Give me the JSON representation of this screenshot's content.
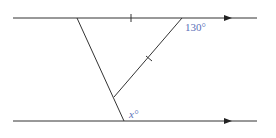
{
  "diagram": {
    "type": "geometry",
    "labels": {
      "angle_top": "130°",
      "angle_bottom": "x°"
    },
    "colors": {
      "line": "#333333",
      "label": "#5a6fb8"
    }
  }
}
